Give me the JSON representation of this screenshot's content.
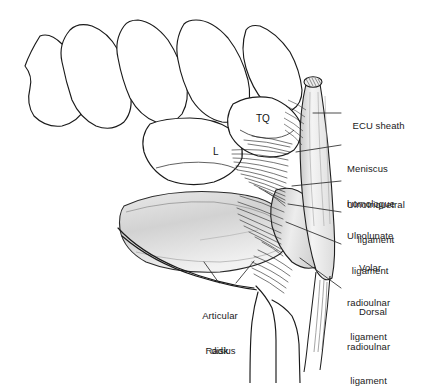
{
  "figure": {
    "background_color": "#ffffff",
    "line_color": "#1a1a1a",
    "shade_color": "#d8d8d8"
  },
  "bone_labels": [
    {
      "name": "triquetrum",
      "text": "TQ",
      "x": 256,
      "y": 113
    },
    {
      "name": "lunate",
      "text": "L",
      "x": 213,
      "y": 146
    }
  ],
  "callouts": [
    {
      "name": "ecu-sheath",
      "lines": [
        "ECU sheath"
      ],
      "align": "left",
      "x": 347,
      "y": 108,
      "leader": [
        [
          341,
          113
        ],
        [
          313,
          113
        ]
      ]
    },
    {
      "name": "meniscus-homologue",
      "lines": [
        "Meniscus",
        "homologue"
      ],
      "align": "left",
      "x": 347,
      "y": 140,
      "leader": [
        [
          341,
          145
        ],
        [
          296,
          152
        ]
      ]
    },
    {
      "name": "ulnotriquetral-ligament",
      "lines": [
        "Ulnotriquetral",
        "ligament"
      ],
      "align": "left",
      "x": 347,
      "y": 176,
      "leader": [
        [
          341,
          181
        ],
        [
          292,
          186
        ]
      ]
    },
    {
      "name": "ulnolunate-ligament",
      "lines": [
        "Ulnolunate",
        "ligament"
      ],
      "align": "left",
      "x": 347,
      "y": 207,
      "leader": [
        [
          341,
          212
        ],
        [
          288,
          204
        ]
      ]
    },
    {
      "name": "volar-radioulnar-ligament",
      "lines": [
        "Volar",
        "radioulnar",
        "ligament"
      ],
      "align": "left",
      "x": 347,
      "y": 239,
      "leader": [
        [
          341,
          244
        ],
        [
          286,
          222
        ]
      ]
    },
    {
      "name": "dorsal-radioulnar-ligament",
      "lines": [
        "Dorsal",
        "radioulnar",
        "ligament"
      ],
      "align": "left",
      "x": 347,
      "y": 283,
      "leader": [
        [
          341,
          288
        ],
        [
          300,
          258
        ]
      ]
    },
    {
      "name": "articular-disk",
      "lines": [
        "Articular",
        "disk"
      ],
      "align": "center",
      "x": 219,
      "y": 287,
      "leader": [
        [
          234,
          285
        ],
        [
          252,
          262
        ]
      ],
      "leader2": [
        [
          219,
          285
        ],
        [
          205,
          263
        ]
      ]
    },
    {
      "name": "radius",
      "lines": [
        "Radius"
      ],
      "align": "left",
      "x": 200,
      "y": 333,
      "leader": null
    }
  ]
}
